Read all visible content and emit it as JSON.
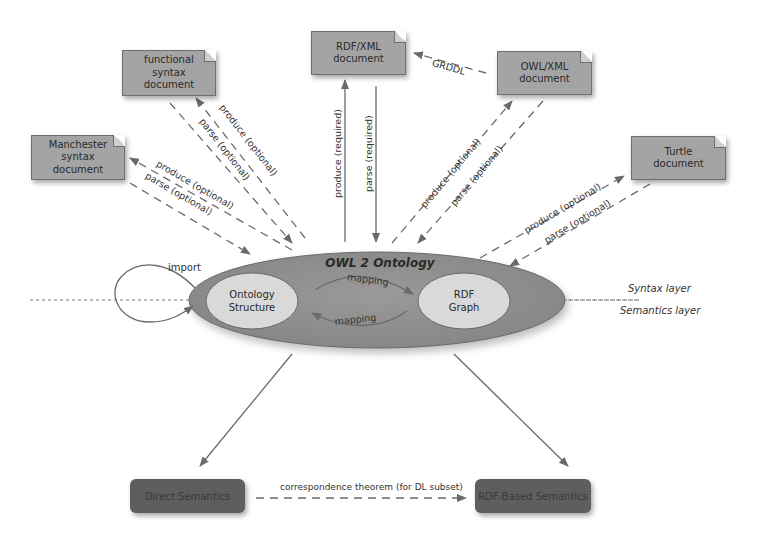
{
  "diagram": {
    "ontology": {
      "title": "OWL 2 Ontology",
      "structure_label": "Ontology\nStructure",
      "graph_label": "RDF\nGraph",
      "mapping_forward": "mapping",
      "mapping_back": "mapping",
      "import_label": "import"
    },
    "documents": [
      {
        "id": "functional",
        "label": "functional\nsyntax\ndocument"
      },
      {
        "id": "manchester",
        "label": "Manchester\nsyntax\ndocument"
      },
      {
        "id": "rdfxml",
        "label": "RDF/XML\ndocument"
      },
      {
        "id": "owlxml",
        "label": "OWL/XML\ndocument"
      },
      {
        "id": "turtle",
        "label": "Turtle\ndocument"
      }
    ],
    "edges": {
      "functional_produce": "produce (optional)",
      "functional_parse": "parse (optional)",
      "manchester_produce": "produce (optional)",
      "manchester_parse": "parse (optional)",
      "rdfxml_produce": "produce (required)",
      "rdfxml_parse": "parse (required)",
      "owlxml_produce": "produce (optional)",
      "owlxml_parse": "parse (optional)",
      "turtle_produce": "produce (optional)",
      "turtle_parse": "parse (optional)",
      "grddl": "GRDDL",
      "correspondence": "correspondence theorem (for DL subset)"
    },
    "layers": {
      "syntax": "Syntax layer",
      "semantics": "Semantics layer"
    },
    "semantics": [
      {
        "id": "direct",
        "label": "Direct Semantics"
      },
      {
        "id": "rdf-based",
        "label": "RDF-Based Semantics"
      }
    ],
    "colors": {
      "doc_fill": "#a4a4a4",
      "ellipse_outer": "#8f8f8f",
      "ellipse_inner": "#d9d9d9",
      "semantics_box": "#5e5e5e",
      "arrow": "#6a6a6a"
    }
  }
}
